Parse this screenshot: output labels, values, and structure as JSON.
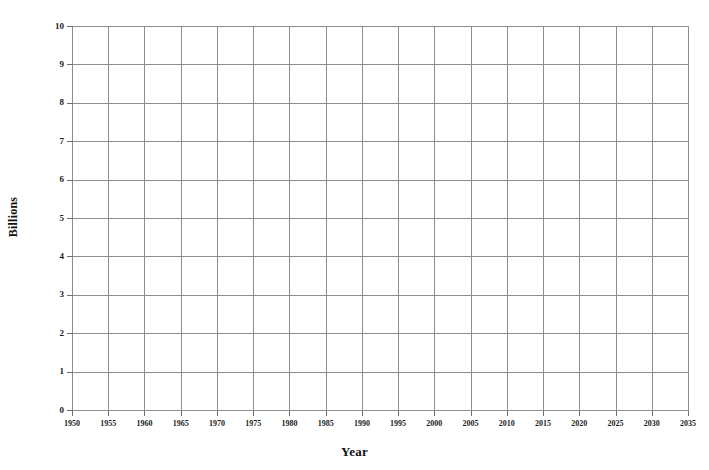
{
  "chart_data": {
    "type": "line",
    "title": "",
    "xlabel": "Year",
    "ylabel": "Billions",
    "xlim": [
      1950,
      2035
    ],
    "ylim": [
      0,
      10
    ],
    "xtick_step": 5,
    "ytick_step": 1,
    "grid": true,
    "legend": null,
    "xticks": [
      "1950",
      "1955",
      "1960",
      "1965",
      "1970",
      "1975",
      "1980",
      "1985",
      "1990",
      "1995",
      "2000",
      "2005",
      "2010",
      "2015",
      "2020",
      "2025",
      "2030",
      "2035"
    ],
    "yticks": [
      "0",
      "1",
      "2",
      "3",
      "4",
      "5",
      "6",
      "7",
      "8",
      "9",
      "10"
    ],
    "series": [],
    "values": [],
    "categories": [],
    "annotations": [],
    "note": "Blank grid worksheet — no data points are plotted in the axes area."
  },
  "style": {
    "background_color": "#ffffff",
    "grid_color": "#8d8d8d",
    "axis_color": "#6f6f6f",
    "text_color": "#1c1c1c"
  }
}
